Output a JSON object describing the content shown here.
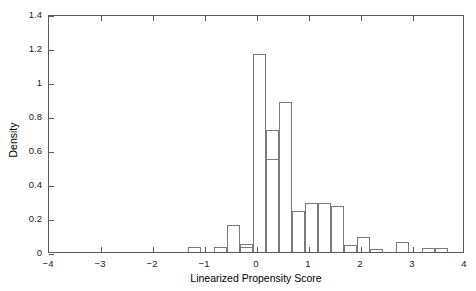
{
  "chart_data": {
    "type": "bar",
    "title": "",
    "subtitle": "",
    "xlabel": "Linearized Propensity Score",
    "ylabel": "Density",
    "xlim": [
      -4,
      4
    ],
    "ylim": [
      0,
      1.4
    ],
    "xticks": [
      -4,
      -3,
      -2,
      -1,
      0,
      1,
      2,
      3,
      4
    ],
    "xtick_labels": [
      "−4",
      "−3",
      "−2",
      "−1",
      "0",
      "1",
      "2",
      "3",
      "4"
    ],
    "yticks": [
      0,
      0.2,
      0.4,
      0.6,
      0.8,
      1,
      1.2,
      1.4
    ],
    "ytick_labels": [
      "0",
      "0.2",
      "0.4",
      "0.6",
      "0.8",
      "1",
      "1.2",
      "1.4"
    ],
    "grid": false,
    "legend": null,
    "bin_width": 0.25,
    "bar_style": {
      "fill": "none",
      "edge_color": "#7a7a7a"
    },
    "bins": [
      {
        "x_left": -2.25,
        "x_right": -2.0,
        "value": 0.03
      },
      {
        "x_left": -1.75,
        "x_right": -1.5,
        "value": 0.03
      },
      {
        "x_left": -1.25,
        "x_right": -1.0,
        "value": 0.03
      },
      {
        "x_left": -1.0,
        "x_right": -0.75,
        "value": 0.16
      },
      {
        "x_left": -0.75,
        "x_right": -0.5,
        "value": 0.05
      },
      {
        "x_left": -0.75,
        "x_right": -0.5,
        "value": 1.165
      },
      {
        "x_left": -0.5,
        "x_right": -0.25,
        "value": 0.72
      },
      {
        "x_left": -0.25,
        "x_right": 0.0,
        "value": 0.55
      },
      {
        "x_left": -0.25,
        "x_right": 0.0,
        "value": 0.88
      },
      {
        "x_left": 0.0,
        "x_right": 0.25,
        "value": 0.24
      },
      {
        "x_left": 0.25,
        "x_right": 0.5,
        "value": 0.29
      },
      {
        "x_left": 0.5,
        "x_right": 0.75,
        "value": 0.29
      },
      {
        "x_left": 0.75,
        "x_right": 1.0,
        "value": 0.27
      },
      {
        "x_left": 1.0,
        "x_right": 1.25,
        "value": 0.04
      },
      {
        "x_left": 1.25,
        "x_right": 1.5,
        "value": 0.09
      },
      {
        "x_left": 1.5,
        "x_right": 1.75,
        "value": 0.02
      },
      {
        "x_left": 2.0,
        "x_right": 2.25,
        "value": 0.06
      },
      {
        "x_left": 2.25,
        "x_right": 2.5,
        "value": 0.025
      },
      {
        "x_left": 2.5,
        "x_right": 2.75,
        "value": 0.025
      }
    ],
    "bars_px": [
      {
        "left": 139,
        "width": 13,
        "top_value": 0.03
      },
      {
        "left": 165,
        "width": 13,
        "top_value": 0.03
      },
      {
        "left": 191,
        "width": 13,
        "top_value": 0.03
      },
      {
        "left": 178,
        "width": 13,
        "top_value": 0.16
      },
      {
        "left": 191,
        "width": 13,
        "top_value": 0.05
      },
      {
        "left": 204,
        "width": 13,
        "top_value": 1.165
      },
      {
        "left": 217,
        "width": 13,
        "top_value": 0.72
      },
      {
        "left": 217,
        "width": 13,
        "top_value": 0.55
      },
      {
        "left": 230,
        "width": 13,
        "top_value": 0.88
      },
      {
        "left": 243,
        "width": 13,
        "top_value": 0.24
      },
      {
        "left": 256,
        "width": 13,
        "top_value": 0.29
      },
      {
        "left": 269,
        "width": 13,
        "top_value": 0.29
      },
      {
        "left": 282,
        "width": 13,
        "top_value": 0.27
      },
      {
        "left": 295,
        "width": 13,
        "top_value": 0.04
      },
      {
        "left": 308,
        "width": 13,
        "top_value": 0.09
      },
      {
        "left": 321,
        "width": 13,
        "top_value": 0.02
      },
      {
        "left": 347,
        "width": 13,
        "top_value": 0.06
      },
      {
        "left": 373,
        "width": 13,
        "top_value": 0.025
      },
      {
        "left": 386,
        "width": 13,
        "top_value": 0.025
      }
    ]
  }
}
